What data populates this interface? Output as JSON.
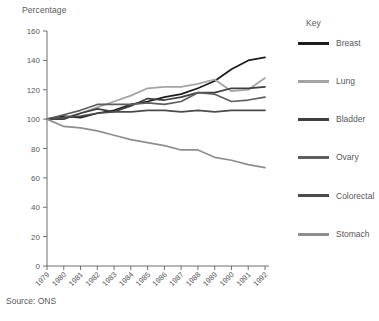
{
  "axis": {
    "y_title": "Percentage",
    "y_ticks": [
      "0",
      "20",
      "40",
      "60",
      "80",
      "100",
      "120",
      "140",
      "160"
    ],
    "x_ticks": [
      "1979",
      "1980",
      "1981",
      "1982",
      "1983",
      "1984",
      "1985",
      "1986",
      "1987",
      "1988",
      "1989",
      "1990",
      "1991",
      "1992"
    ]
  },
  "legend": {
    "title": "Key",
    "items": [
      {
        "label": "Breast",
        "color": "#1b1b1b"
      },
      {
        "label": "Lung",
        "color": "#a3a3a5"
      },
      {
        "label": "Bladder",
        "color": "#3f3f41"
      },
      {
        "label": "Ovary",
        "color": "#5e5e60"
      },
      {
        "label": "Colorectal",
        "color": "#4b4b4d"
      },
      {
        "label": "Stomach",
        "color": "#8e8e90"
      }
    ]
  },
  "source": "Source:  ONS",
  "chart_data": {
    "type": "line",
    "title": "",
    "xlabel": "",
    "ylabel": "Percentage",
    "ylim": [
      0,
      160
    ],
    "ytick_step": 20,
    "grid": false,
    "legend_position": "right",
    "x": [
      "1979",
      "1980",
      "1981",
      "1982",
      "1983",
      "1984",
      "1985",
      "1986",
      "1987",
      "1988",
      "1989",
      "1990",
      "1991",
      "1992"
    ],
    "series": [
      {
        "name": "Breast",
        "color": "#1b1b1b",
        "values": [
          100,
          102,
          101,
          104,
          106,
          110,
          112,
          115,
          117,
          121,
          126,
          134,
          140,
          142
        ]
      },
      {
        "name": "Lung",
        "color": "#a3a3a5",
        "values": [
          100,
          101,
          104,
          108,
          112,
          116,
          121,
          122,
          122,
          124,
          127,
          119,
          120,
          128
        ]
      },
      {
        "name": "Bladder",
        "color": "#3f3f41",
        "values": [
          100,
          100,
          104,
          107,
          105,
          109,
          114,
          113,
          115,
          118,
          118,
          121,
          121,
          122
        ]
      },
      {
        "name": "Ovary",
        "color": "#5e5e60",
        "values": [
          100,
          103,
          106,
          110,
          110,
          110,
          111,
          110,
          112,
          118,
          117,
          112,
          113,
          115
        ]
      },
      {
        "name": "Colorectal",
        "color": "#4b4b4d",
        "values": [
          100,
          101,
          102,
          104,
          105,
          105,
          106,
          106,
          105,
          106,
          105,
          106,
          106,
          106
        ]
      },
      {
        "name": "Stomach",
        "color": "#8e8e90",
        "values": [
          100,
          95,
          94,
          92,
          89,
          86,
          84,
          82,
          79,
          79,
          74,
          72,
          69,
          67
        ]
      }
    ]
  }
}
